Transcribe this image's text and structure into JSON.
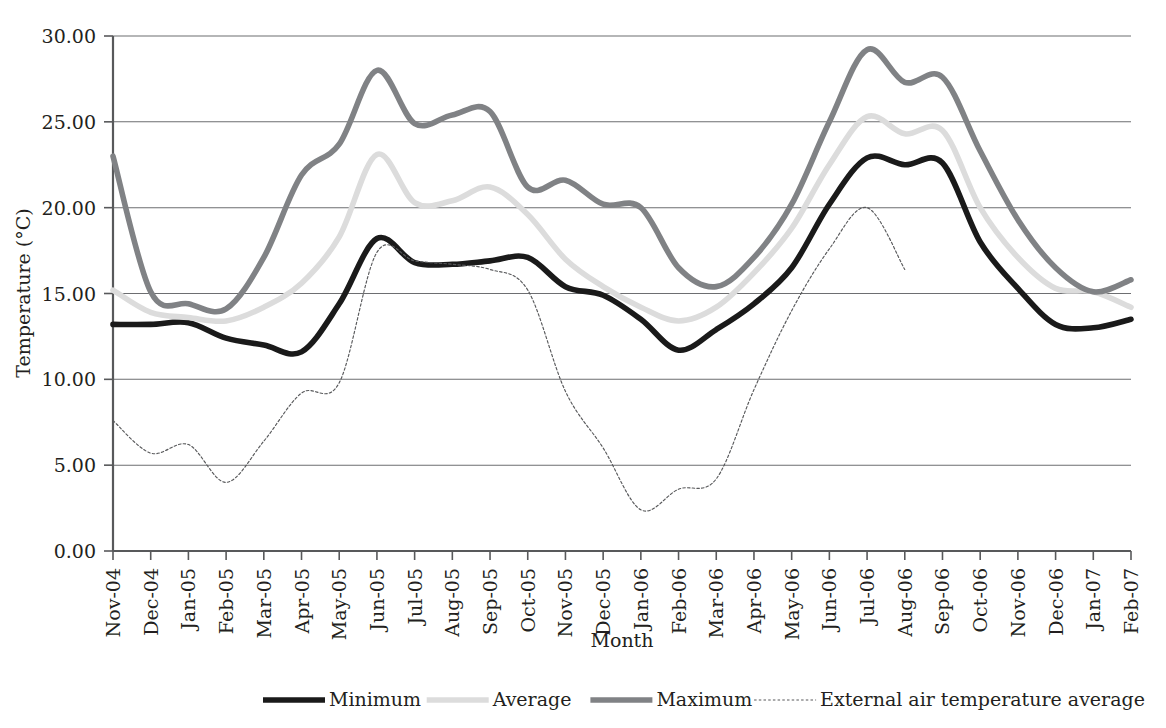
{
  "chart_data": {
    "type": "line",
    "title": "",
    "xlabel": "Month",
    "ylabel": "Temperature (°C)",
    "ylim": [
      0.0,
      30.0
    ],
    "ytick_step": 5.0,
    "ytick_labels": [
      "0.00",
      "5.00",
      "10.00",
      "15.00",
      "20.00",
      "25.00",
      "30.00"
    ],
    "ytick_values": [
      0,
      5,
      10,
      15,
      20,
      25,
      30
    ],
    "grid": true,
    "legend_position": "bottom",
    "categories": [
      "Nov-04",
      "Dec-04",
      "Jan-05",
      "Feb-05",
      "Mar-05",
      "Apr-05",
      "May-05",
      "Jun-05",
      "Jul-05",
      "Aug-05",
      "Sep-05",
      "Oct-05",
      "Nov-05",
      "Dec-05",
      "Jan-06",
      "Feb-06",
      "Mar-06",
      "Apr-06",
      "May-06",
      "Jun-06",
      "Jul-06",
      "Aug-06",
      "Sep-06",
      "Oct-06",
      "Nov-06",
      "Dec-06",
      "Jan-07",
      "Feb-07"
    ],
    "series": [
      {
        "name": "Minimum",
        "color": "#1a1a1a",
        "width": 5.6,
        "dash": "none",
        "values": [
          13.2,
          13.2,
          13.3,
          12.4,
          12.0,
          11.6,
          14.4,
          18.2,
          16.8,
          16.7,
          16.9,
          17.1,
          15.4,
          14.9,
          13.5,
          11.7,
          12.9,
          14.4,
          16.5,
          20.2,
          22.9,
          22.5,
          22.6,
          18.0,
          15.3,
          13.2,
          13.0,
          13.5
        ]
      },
      {
        "name": "Average",
        "color": "#dcdcdc",
        "width": 5.6,
        "dash": "none",
        "values": [
          15.2,
          13.9,
          13.6,
          13.4,
          14.2,
          15.6,
          18.3,
          23.1,
          20.3,
          20.4,
          21.2,
          19.6,
          17.0,
          15.4,
          14.2,
          13.4,
          14.2,
          16.2,
          18.8,
          22.5,
          25.3,
          24.3,
          24.5,
          20.0,
          17.1,
          15.3,
          15.1,
          14.2
        ]
      },
      {
        "name": "Maximum",
        "color": "#808285",
        "width": 5.6,
        "dash": "none",
        "values": [
          23.0,
          15.1,
          14.4,
          14.1,
          17.1,
          21.9,
          23.7,
          28.0,
          24.9,
          25.4,
          25.6,
          21.2,
          21.6,
          20.2,
          20.0,
          16.5,
          15.4,
          17.1,
          20.2,
          25.0,
          29.2,
          27.3,
          27.6,
          23.3,
          19.3,
          16.5,
          15.1,
          15.8
        ]
      },
      {
        "name": "External air temperature average",
        "color": "#58595b",
        "width": 1.15,
        "dash": "2.5 2.2",
        "values": [
          7.6,
          5.7,
          6.2,
          4.0,
          6.4,
          9.2,
          9.8,
          17.4,
          16.9,
          16.7,
          16.4,
          15.2,
          9.3,
          6.0,
          2.4,
          3.6,
          4.2,
          9.4,
          14.0,
          17.6,
          20.0,
          16.4,
          null,
          null,
          null,
          null,
          null,
          null
        ]
      }
    ]
  },
  "legend": {
    "items": [
      {
        "label": "Minimum"
      },
      {
        "label": "Average"
      },
      {
        "label": "Maximum"
      },
      {
        "label": "External air temperature average"
      }
    ]
  }
}
